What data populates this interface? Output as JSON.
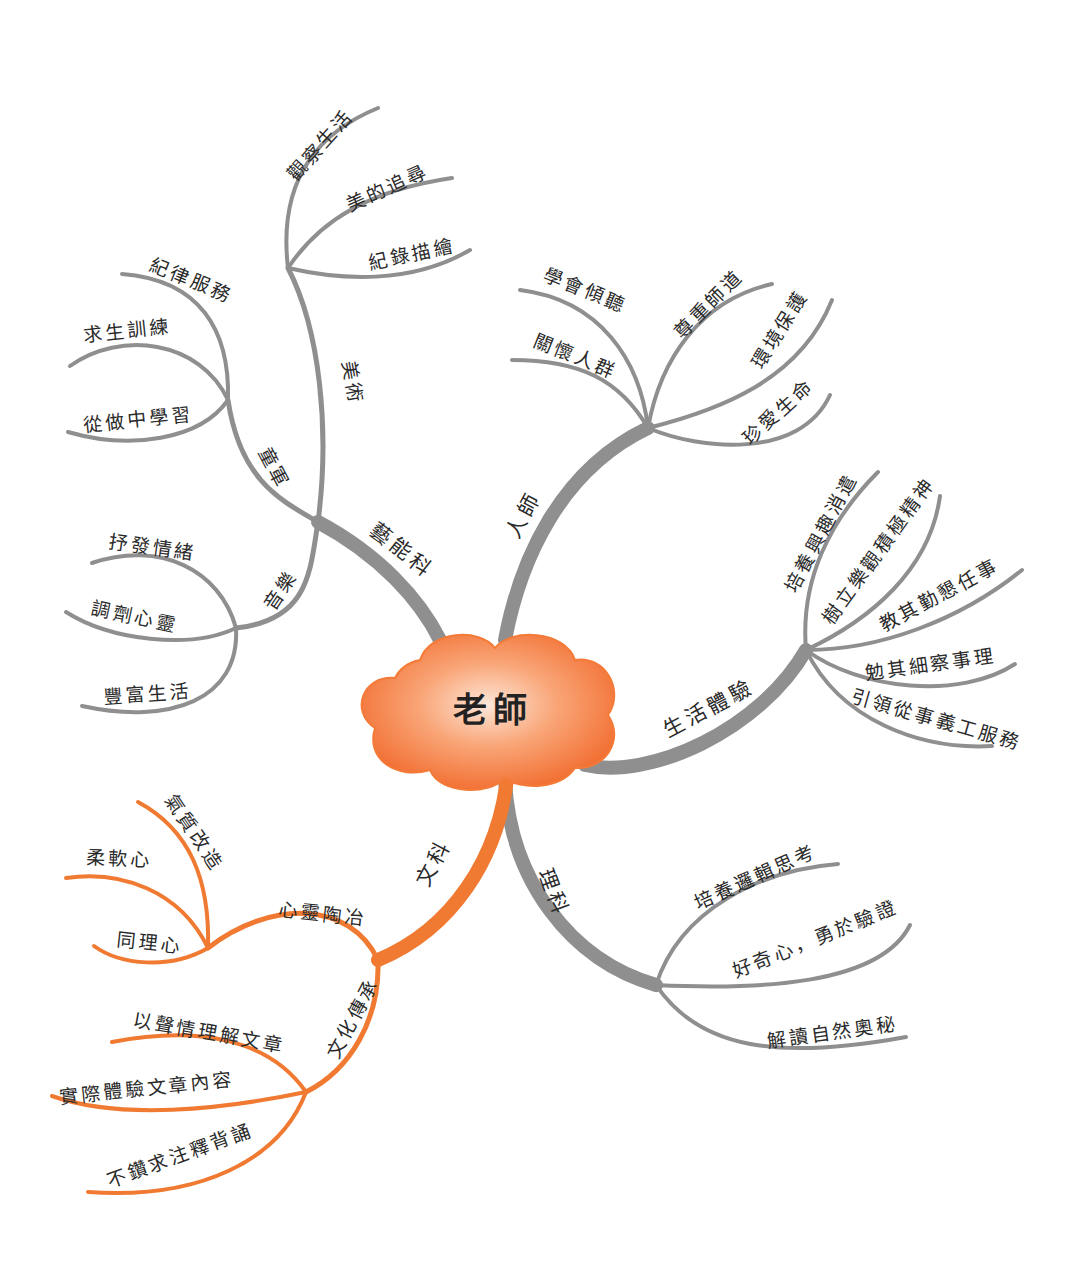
{
  "center": {
    "label": "老師"
  },
  "colors": {
    "gray_branch": "#8f8f8f",
    "orange_branch": "#f07a32",
    "cloud_inner": "#fde0cf",
    "cloud_outer": "#f26f2a"
  },
  "branches": [
    {
      "id": "yinengke",
      "label": "藝能科",
      "color": "gray",
      "children": [
        {
          "label": "美術",
          "children": [
            "觀察生活",
            "美的追尋",
            "紀錄描繪"
          ]
        },
        {
          "label": "童軍",
          "children": [
            "紀律服務",
            "求生訓練",
            "從做中學習"
          ]
        },
        {
          "label": "音樂",
          "children": [
            "抒發情緒",
            "調劑心靈",
            "豐富生活"
          ]
        }
      ]
    },
    {
      "id": "renshi",
      "label": "人師",
      "color": "gray",
      "children": [
        "學會傾聽",
        "關懷人群",
        "尊重師道",
        "環境保護",
        "珍愛生命"
      ]
    },
    {
      "id": "shenghuo",
      "label": "生活體驗",
      "color": "gray",
      "children": [
        "培養興趣消遣",
        "樹立樂觀積極精神",
        "教其勤懇任事",
        "勉其細察事理",
        "引領從事義工服務"
      ]
    },
    {
      "id": "like",
      "label": "理科",
      "color": "gray",
      "children": [
        "培養邏輯思考",
        "好奇心，勇於驗證",
        "解讀自然奧秘"
      ]
    },
    {
      "id": "wenke",
      "label": "文科",
      "color": "orange",
      "children": [
        {
          "label": "心靈陶冶",
          "children": [
            "氣質改造",
            "柔軟心",
            "同理心"
          ]
        },
        {
          "label": "文化傳承",
          "children": [
            "以聲情理解文章",
            "實際體驗文章內容",
            "不鑽求注釋背誦"
          ]
        }
      ]
    }
  ]
}
